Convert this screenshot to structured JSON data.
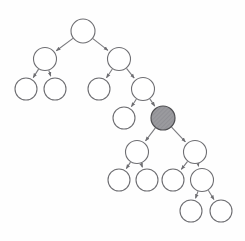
{
  "diagram": {
    "type": "binary-tree",
    "canvas": {
      "width": 245,
      "height": 241
    },
    "style": {
      "background_color": "#fefefe",
      "node_fill": "#ffffff",
      "node_stroke": "#6e6e72",
      "highlight_fill": "#9a9a9e",
      "highlight_stroke": "#4d4d50",
      "edge_color": "#7a7a7e",
      "arrowhead": "filled-triangle"
    },
    "nodes": [
      {
        "id": "n0",
        "label": "",
        "cx": 83,
        "cy": 31,
        "r": 12,
        "level": 0,
        "highlighted": false
      },
      {
        "id": "n1",
        "label": "",
        "cx": 45,
        "cy": 59,
        "r": 11.5,
        "level": 1,
        "highlighted": false
      },
      {
        "id": "n2",
        "label": "",
        "cx": 119,
        "cy": 59,
        "r": 11.5,
        "level": 1,
        "highlighted": false
      },
      {
        "id": "n3",
        "label": "",
        "cx": 26,
        "cy": 89,
        "r": 11,
        "level": 2,
        "highlighted": false
      },
      {
        "id": "n4",
        "label": "",
        "cx": 55,
        "cy": 89,
        "r": 11,
        "level": 2,
        "highlighted": false
      },
      {
        "id": "n5",
        "label": "",
        "cx": 99,
        "cy": 89,
        "r": 11,
        "level": 2,
        "highlighted": false
      },
      {
        "id": "n6",
        "label": "",
        "cx": 143,
        "cy": 89,
        "r": 11.5,
        "level": 2,
        "highlighted": false
      },
      {
        "id": "n7",
        "label": "",
        "cx": 124,
        "cy": 118,
        "r": 11,
        "level": 3,
        "highlighted": false
      },
      {
        "id": "n8",
        "label": "",
        "cx": 163,
        "cy": 118,
        "r": 12,
        "level": 3,
        "highlighted": true
      },
      {
        "id": "n9",
        "label": "",
        "cx": 137,
        "cy": 152,
        "r": 11.5,
        "level": 4,
        "highlighted": false
      },
      {
        "id": "n10",
        "label": "",
        "cx": 195,
        "cy": 152,
        "r": 11.5,
        "level": 4,
        "highlighted": false
      },
      {
        "id": "n11",
        "label": "",
        "cx": 119,
        "cy": 180,
        "r": 11,
        "level": 5,
        "highlighted": false
      },
      {
        "id": "n12",
        "label": "",
        "cx": 147,
        "cy": 180,
        "r": 11,
        "level": 5,
        "highlighted": false
      },
      {
        "id": "n13",
        "label": "",
        "cx": 173,
        "cy": 180,
        "r": 11,
        "level": 5,
        "highlighted": false
      },
      {
        "id": "n14",
        "label": "",
        "cx": 202,
        "cy": 180,
        "r": 11.5,
        "level": 5,
        "highlighted": false
      },
      {
        "id": "n15",
        "label": "",
        "cx": 191,
        "cy": 211,
        "r": 11,
        "level": 6,
        "highlighted": false
      },
      {
        "id": "n16",
        "label": "",
        "cx": 221,
        "cy": 211,
        "r": 11,
        "level": 6,
        "highlighted": false
      }
    ],
    "edges": [
      {
        "from": "n0",
        "to": "n1"
      },
      {
        "from": "n0",
        "to": "n2"
      },
      {
        "from": "n1",
        "to": "n3"
      },
      {
        "from": "n1",
        "to": "n4"
      },
      {
        "from": "n2",
        "to": "n5"
      },
      {
        "from": "n2",
        "to": "n6"
      },
      {
        "from": "n6",
        "to": "n7"
      },
      {
        "from": "n6",
        "to": "n8"
      },
      {
        "from": "n8",
        "to": "n9"
      },
      {
        "from": "n8",
        "to": "n10"
      },
      {
        "from": "n9",
        "to": "n11"
      },
      {
        "from": "n9",
        "to": "n12"
      },
      {
        "from": "n10",
        "to": "n13"
      },
      {
        "from": "n10",
        "to": "n14"
      },
      {
        "from": "n14",
        "to": "n15"
      },
      {
        "from": "n14",
        "to": "n16"
      }
    ]
  }
}
